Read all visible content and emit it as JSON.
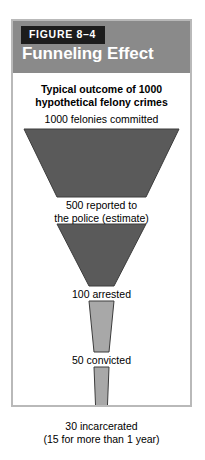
{
  "figure": {
    "tag": "FIGURE 8–4",
    "title": "Funneling Effect",
    "subtitle": "Typical outcome of\n1000 hypothetical felony crimes"
  },
  "colors": {
    "header_band": "#8a8a8a",
    "tag_background": "#1c1c1c",
    "tag_text": "#ffffff",
    "title_text": "#ffffff",
    "frame_border": "#b9b9b9",
    "segment_dark": "#5a5a5a",
    "segment_light": "#a8a8a8",
    "segment_outline": "#3c3c3c",
    "label_text": "#000000",
    "page_background": "#ffffff"
  },
  "labels": {
    "stage_1": "1000 felonies committed",
    "stage_2": "500 reported to\nthe police (estimate)",
    "stage_3": "100 arrested",
    "stage_4": "50 convicted",
    "stage_5": "30 incarcerated\n(15 for more than 1 year)"
  },
  "chart_data": {
    "type": "funnel",
    "title": "Funneling Effect",
    "subtitle": "Typical outcome of 1000 hypothetical felony crimes",
    "xlabel": "",
    "ylabel": "",
    "categories": [
      "felonies committed",
      "reported to the police (estimate)",
      "arrested",
      "convicted",
      "incarcerated"
    ],
    "values": [
      1000,
      500,
      100,
      50,
      30
    ],
    "value_labels": [
      "1000 felonies committed",
      "500 reported to the police (estimate)",
      "100 arrested",
      "50 convicted",
      "30 incarcerated (15 for more than 1 year)"
    ],
    "annotations": [
      "15 for more than 1 year"
    ],
    "segments": [
      {
        "from": 1000,
        "to": 500,
        "shade": "dark"
      },
      {
        "from": 500,
        "to": 100,
        "shade": "dark"
      },
      {
        "from": 100,
        "to": 50,
        "shade": "light"
      },
      {
        "from": 50,
        "to": 30,
        "shade": "light"
      }
    ],
    "legend": [],
    "grid": false
  }
}
